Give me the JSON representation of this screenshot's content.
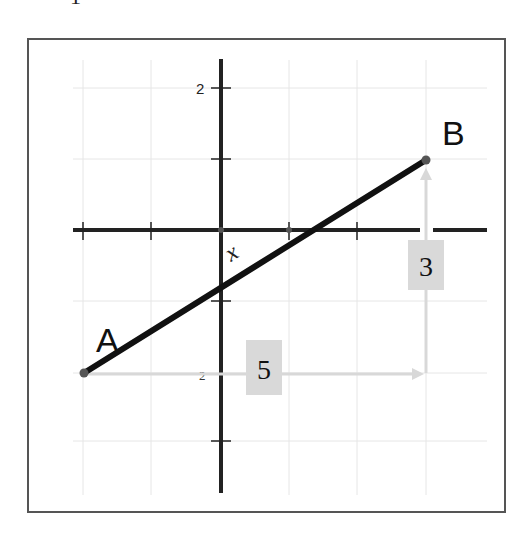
{
  "diagram": {
    "title_fragment": "1",
    "point_a": {
      "label": "A",
      "grid_x": -2,
      "grid_y": -2
    },
    "point_b": {
      "label": "B",
      "grid_x": 3,
      "grid_y": 1
    },
    "angle_label": "x",
    "run_label": "5",
    "rise_label": "3",
    "y_tick_top": "2",
    "y_tick_bottom": "2",
    "colors": {
      "line": "#111111",
      "axis": "#222222",
      "grid": "#e6e6e6",
      "arrow": "#d8d8d8",
      "label_box": "#d9d9d9",
      "frame": "#555555"
    }
  }
}
